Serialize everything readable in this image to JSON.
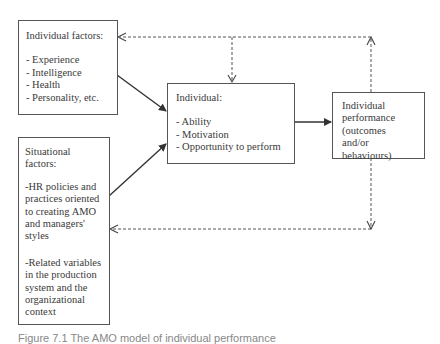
{
  "diagram": {
    "individual_factors": {
      "title": "Individual factors:",
      "items": [
        "- Experience",
        "- Intelligence",
        "- Health",
        "- Personality, etc."
      ]
    },
    "situational_factors": {
      "title": "Situational factors:",
      "items": [
        "-HR policies and practices oriented to creating AMO and managers' styles",
        "-Related variables in the production system and the organizational context"
      ]
    },
    "individual": {
      "title": "Individual:",
      "items": [
        "- Ability",
        "- Motivation",
        "- Opportunity to perform"
      ]
    },
    "performance": {
      "title": "Individual performance (outcomes and/or behaviours)"
    },
    "edges": [
      {
        "from": "individual_factors",
        "to": "individual",
        "style": "solid"
      },
      {
        "from": "situational_factors",
        "to": "individual",
        "style": "solid"
      },
      {
        "from": "individual",
        "to": "performance",
        "style": "solid"
      },
      {
        "from": "performance",
        "to": "individual_factors",
        "style": "dashed"
      },
      {
        "from": "performance",
        "to": "individual",
        "style": "dashed"
      },
      {
        "from": "performance",
        "to": "situational_factors",
        "style": "dashed"
      }
    ],
    "colors": {
      "line": "#444444",
      "text": "#3a3a3a"
    }
  },
  "caption": "Figure 7.1 The AMO model of individual performance"
}
